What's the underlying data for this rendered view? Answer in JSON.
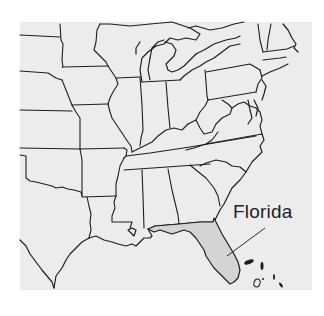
{
  "map": {
    "region": "Eastern United States",
    "highlighted_state": "Florida",
    "callout_label": "Florida",
    "colors": {
      "page_background": "#ffffff",
      "land": "#ececec",
      "highlight_fill": "#d4d4d4",
      "borders": "#1e1e1e",
      "label_text": "#222222"
    }
  }
}
